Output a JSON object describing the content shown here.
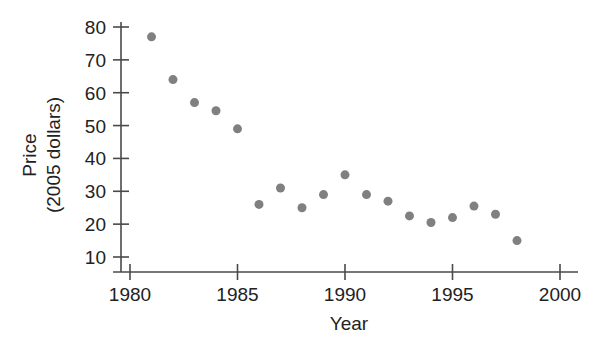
{
  "chart_data": {
    "type": "scatter",
    "title": "",
    "xlabel": "Year",
    "ylabel": "Price\n(2005 dollars)",
    "ylabel_line1": "Price",
    "ylabel_line2": "(2005 dollars)",
    "xlim": [
      1979.05,
      2001.0
    ],
    "ylim": [
      4.0,
      83.5
    ],
    "xticks": [
      1980,
      1985,
      1990,
      1995,
      2000
    ],
    "xtick_labels": [
      "1980",
      "1985",
      "1990",
      "1995",
      "2000"
    ],
    "yticks": [
      10,
      20,
      30,
      40,
      50,
      60,
      70,
      80
    ],
    "ytick_labels": [
      "10",
      "20",
      "30",
      "40",
      "50",
      "60",
      "70",
      "80"
    ],
    "grid": false,
    "legend": false,
    "marker_color": "#808080",
    "marker_size": 9,
    "axis_color": "#4a4a4a",
    "background_color": "#ffffff",
    "x": [
      1981,
      1982,
      1983,
      1984,
      1985,
      1986,
      1987,
      1988,
      1989,
      1990,
      1991,
      1992,
      1993,
      1994,
      1995,
      1996,
      1997,
      1998
    ],
    "y": [
      77,
      64,
      57,
      54.5,
      49,
      26,
      31,
      25,
      29,
      35,
      29,
      27,
      22.5,
      20.5,
      22,
      25.5,
      23,
      15
    ],
    "points": [
      {
        "year": 1981,
        "price": 77
      },
      {
        "year": 1982,
        "price": 64
      },
      {
        "year": 1983,
        "price": 57
      },
      {
        "year": 1984,
        "price": 54.5
      },
      {
        "year": 1985,
        "price": 49
      },
      {
        "year": 1986,
        "price": 26
      },
      {
        "year": 1987,
        "price": 31
      },
      {
        "year": 1988,
        "price": 25
      },
      {
        "year": 1989,
        "price": 29
      },
      {
        "year": 1990,
        "price": 35
      },
      {
        "year": 1991,
        "price": 29
      },
      {
        "year": 1992,
        "price": 27
      },
      {
        "year": 1993,
        "price": 22.5
      },
      {
        "year": 1994,
        "price": 20.5
      },
      {
        "year": 1995,
        "price": 22
      },
      {
        "year": 1996,
        "price": 25.5
      },
      {
        "year": 1997,
        "price": 23
      },
      {
        "year": 1998,
        "price": 15
      }
    ]
  }
}
